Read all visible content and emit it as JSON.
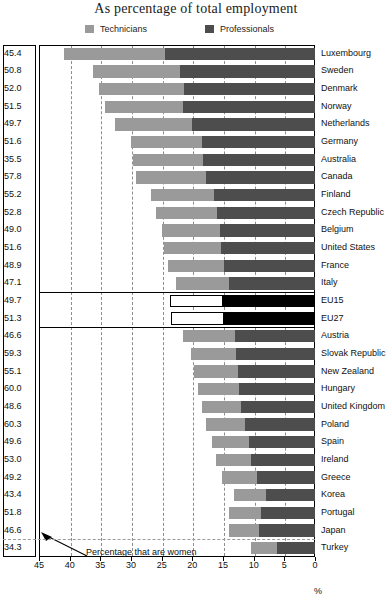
{
  "title": "As percentage of total employment",
  "legend": [
    {
      "key": "technicians",
      "label": "Technicians",
      "color": "#9a9a9a"
    },
    {
      "key": "professionals",
      "label": "Professionals",
      "color": "#4d4d4d"
    }
  ],
  "annotation": "Percentage that are women",
  "axis_unit": "%",
  "chart_data": {
    "type": "bar",
    "orientation": "horizontal-stacked-reversed",
    "title": "As percentage of total employment",
    "xlabel": "%",
    "ylabel": "",
    "xlim": [
      45,
      0
    ],
    "xticks": [
      45,
      40,
      35,
      30,
      25,
      20,
      15,
      10,
      5,
      0
    ],
    "grid": true,
    "legend_position": "top",
    "categories": [
      "Luxembourg",
      "Sweden",
      "Denmark",
      "Norway",
      "Netherlands",
      "Germany",
      "Australia",
      "Canada",
      "Finland",
      "Czech Republic",
      "Belgium",
      "United States",
      "France",
      "Italy",
      "EU15",
      "EU27",
      "Austria",
      "Slovak Republic",
      "New Zealand",
      "Hungary",
      "United Kingdom",
      "Poland",
      "Spain",
      "Ireland",
      "Greece",
      "Korea",
      "Portugal",
      "Japan",
      "Turkey"
    ],
    "series": [
      {
        "name": "Technicians",
        "color": "#9a9a9a",
        "values": [
          16.5,
          14.2,
          13.9,
          12.8,
          12.6,
          11.5,
          11.5,
          11.4,
          10.2,
          10.0,
          9.5,
          9.3,
          9.1,
          8.6,
          8.6,
          8.6,
          8.5,
          7.4,
          7.2,
          6.6,
          6.4,
          6.3,
          6.0,
          5.8,
          5.6,
          5.2,
          5.3,
          4.8,
          4.3
        ]
      },
      {
        "name": "Professionals",
        "color": "#4d4d4d",
        "values": [
          24.5,
          22.0,
          21.3,
          21.5,
          20.0,
          18.5,
          18.2,
          17.8,
          16.5,
          16.0,
          15.5,
          15.3,
          14.8,
          14.0,
          15.0,
          14.8,
          13.0,
          12.8,
          12.5,
          12.4,
          12.1,
          11.4,
          10.8,
          10.4,
          9.5,
          8.0,
          8.8,
          9.2,
          6.2
        ]
      }
    ],
    "women_percentage_label": "Percentage that are women",
    "women_percentage": [
      45.4,
      50.8,
      52.0,
      51.5,
      49.7,
      51.6,
      35.5,
      57.8,
      55.2,
      52.8,
      49.0,
      51.6,
      48.9,
      47.1,
      49.7,
      51.3,
      46.6,
      59.3,
      55.1,
      60.0,
      48.6,
      60.3,
      49.6,
      53.0,
      49.2,
      43.4,
      51.8,
      46.6,
      34.3
    ],
    "highlight_rows": [
      "EU15",
      "EU27"
    ]
  }
}
